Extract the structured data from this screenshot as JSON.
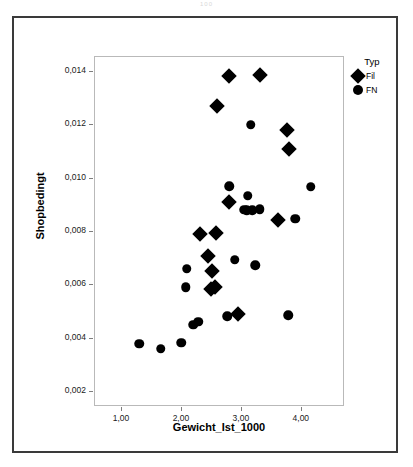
{
  "page_artifact": "100",
  "chart_data": {
    "type": "scatter",
    "title": "",
    "xlabel": "Gewicht_Ist_1000",
    "ylabel": "Shopbedingt",
    "xlim": [
      0.55,
      4.72
    ],
    "ylim": [
      0.00145,
      0.01455
    ],
    "grid": false,
    "legend": {
      "title": "Typ",
      "position": "top-right",
      "entries": [
        {
          "label": "Fil",
          "marker": "diamond"
        },
        {
          "label": "FN",
          "marker": "circle"
        }
      ]
    },
    "xticks": [
      1.0,
      2.0,
      3.0,
      4.0
    ],
    "xtick_labels": [
      "1,00",
      "2,00",
      "3,00",
      "4,00"
    ],
    "yticks": [
      0.002,
      0.004,
      0.006,
      0.008,
      0.01,
      0.012,
      0.014
    ],
    "ytick_labels": [
      "0,002",
      "0,004",
      "0,006",
      "0,008",
      "0,010",
      "0,012",
      "0,014"
    ],
    "series": [
      {
        "name": "Fil",
        "marker": "diamond",
        "color": "#000000",
        "points": [
          [
            2.79,
            0.01385
          ],
          [
            3.3,
            0.01388
          ],
          [
            2.58,
            0.01272
          ],
          [
            3.76,
            0.01182
          ],
          [
            3.79,
            0.0111
          ],
          [
            2.78,
            0.00912
          ],
          [
            3.61,
            0.00845
          ],
          [
            2.3,
            0.00791
          ],
          [
            2.57,
            0.00798
          ],
          [
            2.44,
            0.00711
          ],
          [
            2.5,
            0.00653
          ],
          [
            2.49,
            0.00585
          ],
          [
            2.55,
            0.00594
          ],
          [
            2.93,
            0.00494
          ]
        ]
      },
      {
        "name": "FN",
        "marker": "circle",
        "color": "#000000",
        "points": [
          [
            3.15,
            0.01202
          ],
          [
            4.15,
            0.00969
          ],
          [
            2.79,
            0.00972
          ],
          [
            3.1,
            0.00936
          ],
          [
            3.04,
            0.00884
          ],
          [
            3.08,
            0.00882
          ],
          [
            3.17,
            0.00881
          ],
          [
            3.3,
            0.00886
          ],
          [
            3.89,
            0.00849
          ],
          [
            2.88,
            0.00697
          ],
          [
            3.22,
            0.00675
          ],
          [
            2.08,
            0.00663
          ],
          [
            2.06,
            0.00594
          ],
          [
            2.76,
            0.00484
          ],
          [
            3.77,
            0.00488
          ],
          [
            2.19,
            0.00453
          ],
          [
            2.27,
            0.00464
          ],
          [
            1.29,
            0.00381
          ],
          [
            1.65,
            0.00363
          ],
          [
            1.99,
            0.00385
          ]
        ]
      }
    ]
  }
}
